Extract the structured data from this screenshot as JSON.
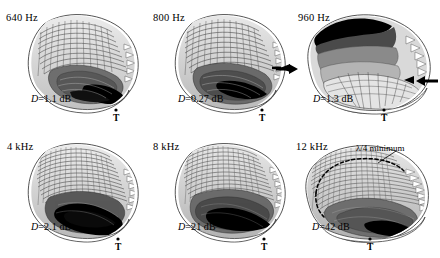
{
  "figure": {
    "type": "multi-panel-surface-plot",
    "background_color": "#ffffff",
    "rows": 2,
    "columns": 3
  },
  "chart_data": {
    "type": "heatmap",
    "title": "",
    "subtitle": "",
    "xlabel": "",
    "ylabel": "",
    "grid": false,
    "legend_position": "none",
    "panels": [
      {
        "id": "panel-640hz",
        "frequency": "640 Hz",
        "directivity_label": "D=1.1 dB",
        "directivity_symbol": "D",
        "directivity_value": 1.1,
        "directivity_units": "dB",
        "tragus_marker": "T",
        "arrows": [],
        "annotation": ""
      },
      {
        "id": "panel-800hz",
        "frequency": "800 Hz",
        "directivity_label": "D=0.27 dB",
        "directivity_symbol": "D",
        "directivity_value": 0.27,
        "directivity_units": "dB",
        "tragus_marker": "T",
        "arrows": [],
        "annotation": ""
      },
      {
        "id": "panel-960hz",
        "frequency": "960 Hz",
        "directivity_label": "D=1.3 dB",
        "directivity_symbol": "D",
        "directivity_value": 1.3,
        "directivity_units": "dB",
        "tragus_marker": "T",
        "arrows": [
          "arrow-left-pointing-right",
          "arrow-right-pointing-left"
        ],
        "annotation": ""
      },
      {
        "id": "panel-4khz",
        "frequency": "4 kHz",
        "directivity_label": "D=2.1 dB",
        "directivity_symbol": "D",
        "directivity_value": 2.1,
        "directivity_units": "dB",
        "tragus_marker": "T",
        "arrows": [],
        "annotation": ""
      },
      {
        "id": "panel-8khz",
        "frequency": "8 kHz",
        "directivity_label": "D=21 dB",
        "directivity_symbol": "D",
        "directivity_value": 21,
        "directivity_units": "dB",
        "tragus_marker": "T",
        "arrows": [],
        "annotation": ""
      },
      {
        "id": "panel-12khz",
        "frequency": "12 kHz",
        "directivity_label": "D=42 dB",
        "directivity_symbol": "D",
        "directivity_value": 42,
        "directivity_units": "dB",
        "tragus_marker": "T",
        "arrows": [],
        "annotation": "λ/4 minimum"
      }
    ],
    "categories": [
      "640 Hz",
      "800 Hz",
      "960 Hz",
      "4 kHz",
      "8 kHz",
      "12 kHz"
    ],
    "values": [
      1.1,
      0.27,
      1.3,
      2.1,
      21,
      42
    ],
    "series": [
      {
        "name": "Directivity D (dB)",
        "values": [
          1.1,
          0.27,
          1.3,
          2.1,
          21,
          42
        ]
      }
    ],
    "colors": {
      "outline": "#111111",
      "surface_light": "#e8e8e8",
      "surface_mid": "#9a9a9a",
      "surface_dark": "#4a4a4a",
      "surface_black": "#000000",
      "background": "#ffffff"
    }
  }
}
